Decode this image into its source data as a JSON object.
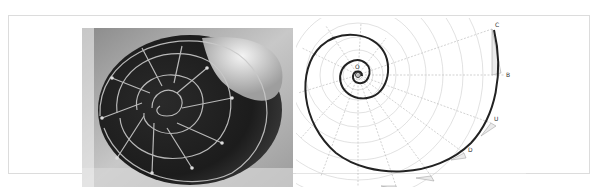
{
  "figure": {
    "panels": [
      {
        "id": "photo",
        "subject": "nautilus-shell-cross-section"
      },
      {
        "id": "diagram",
        "subject": "logarithmic-spiral-construction"
      }
    ],
    "diagram_labels": {
      "center": "O",
      "c": "C",
      "b": "B",
      "u": "U",
      "d": "D"
    },
    "colors": {
      "frame": "#dcdcdc",
      "spiral": "#222222",
      "guide": "#9a9a9a",
      "photo_dark": "#1a1a1a",
      "photo_light": "#e8e8e8"
    }
  }
}
